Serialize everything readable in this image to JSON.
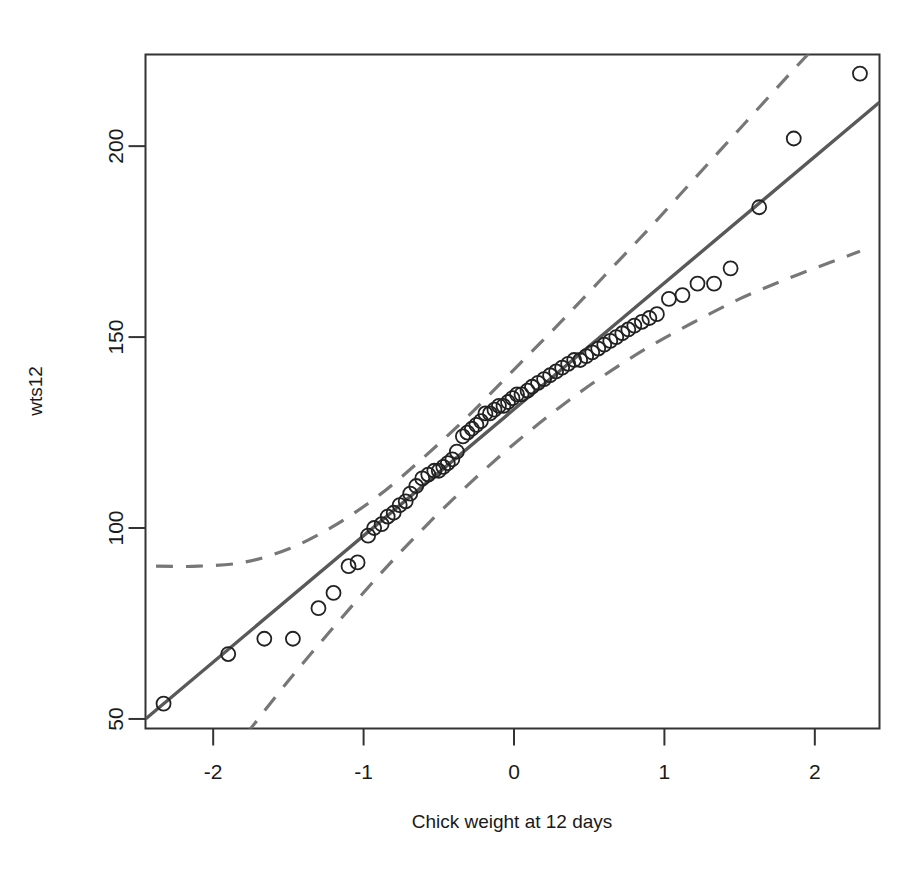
{
  "chart_data": {
    "type": "scatter",
    "title": "",
    "subtitle": "",
    "xlabel": "Chick weight at 12 days",
    "ylabel": "wts12",
    "xlim": [
      -2.45,
      2.43
    ],
    "ylim": [
      47.5,
      224
    ],
    "grid": false,
    "legend": null,
    "x_ticks": [
      -2,
      -1,
      0,
      1,
      2
    ],
    "x_tick_labels": [
      "-2",
      "-1",
      "0",
      "1",
      "2"
    ],
    "y_ticks": [
      50,
      100,
      150,
      200
    ],
    "y_tick_labels": [
      "50",
      "100",
      "150",
      "200"
    ],
    "marker": {
      "shape": "open-circle",
      "radius_px": 7,
      "stroke": "#222222",
      "fill": "none",
      "stroke_width": 1.8
    },
    "series": [
      {
        "name": "observations",
        "type": "scatter",
        "x": [
          -2.33,
          -1.9,
          -1.66,
          -1.47,
          -1.3,
          -1.2,
          -1.1,
          -1.04,
          -0.97,
          -0.93,
          -0.88,
          -0.84,
          -0.8,
          -0.76,
          -0.72,
          -0.69,
          -0.65,
          -0.61,
          -0.57,
          -0.53,
          -0.5,
          -0.47,
          -0.44,
          -0.41,
          -0.38,
          -0.34,
          -0.31,
          -0.28,
          -0.25,
          -0.22,
          -0.19,
          -0.16,
          -0.13,
          -0.1,
          -0.07,
          -0.04,
          -0.01,
          0.02,
          0.05,
          0.09,
          0.12,
          0.16,
          0.2,
          0.24,
          0.28,
          0.32,
          0.36,
          0.4,
          0.44,
          0.48,
          0.52,
          0.56,
          0.6,
          0.64,
          0.68,
          0.72,
          0.76,
          0.8,
          0.85,
          0.9,
          0.95,
          1.03,
          1.12,
          1.22,
          1.33,
          1.44,
          1.63,
          1.86,
          2.3
        ],
        "y": [
          54,
          67,
          71,
          71,
          79,
          83,
          90,
          91,
          98,
          100,
          101,
          103,
          104,
          106,
          107,
          109,
          111,
          113,
          114,
          115,
          115,
          116,
          117,
          118,
          120,
          124,
          125,
          126,
          127,
          128,
          130,
          130,
          131,
          132,
          132,
          133,
          134,
          135,
          135,
          136,
          137,
          138,
          139,
          140,
          141,
          142,
          143,
          144,
          144,
          145,
          146,
          147,
          148,
          149,
          150,
          151,
          152,
          153,
          154,
          155,
          156,
          160,
          161,
          164,
          164,
          168,
          184,
          202,
          219
        ]
      },
      {
        "name": "regression-line",
        "type": "line",
        "style": "solid",
        "color": "#595959",
        "width_px": 3.4,
        "x": [
          -2.45,
          2.43
        ],
        "y": [
          50.0,
          211.5
        ]
      },
      {
        "name": "upper-band",
        "type": "line",
        "style": "dashed",
        "color": "#777777",
        "width_px": 3.2,
        "x": [
          -2.38,
          -2.1,
          -1.8,
          -1.5,
          -1.2,
          -0.9,
          -0.6,
          -0.3,
          0.0,
          0.3,
          0.6,
          0.9,
          1.2,
          1.5,
          1.8,
          2.0
        ],
        "y": [
          90.0,
          90.0,
          91.0,
          94.5,
          100.5,
          108.5,
          118.5,
          129.5,
          141.5,
          153.5,
          166.0,
          178.5,
          191.5,
          204.5,
          217.5,
          226.0
        ]
      },
      {
        "name": "lower-band",
        "type": "line",
        "style": "dashed",
        "color": "#777777",
        "width_px": 3.2,
        "x": [
          -1.78,
          -1.5,
          -1.2,
          -0.9,
          -0.6,
          -0.3,
          0.0,
          0.3,
          0.6,
          0.9,
          1.2,
          1.5,
          1.8,
          2.1,
          2.3
        ],
        "y": [
          46.0,
          60.0,
          74.0,
          87.5,
          100.0,
          111.5,
          122.0,
          131.5,
          140.0,
          147.5,
          154.0,
          160.0,
          165.0,
          169.5,
          172.5
        ]
      }
    ]
  },
  "axes": {
    "x_title": "Chick weight at 12 days",
    "y_title": "wts12"
  },
  "colors": {
    "background": "#ffffff",
    "axis": "#333333",
    "fit_line": "#595959",
    "band": "#777777",
    "marker_stroke": "#222222"
  }
}
